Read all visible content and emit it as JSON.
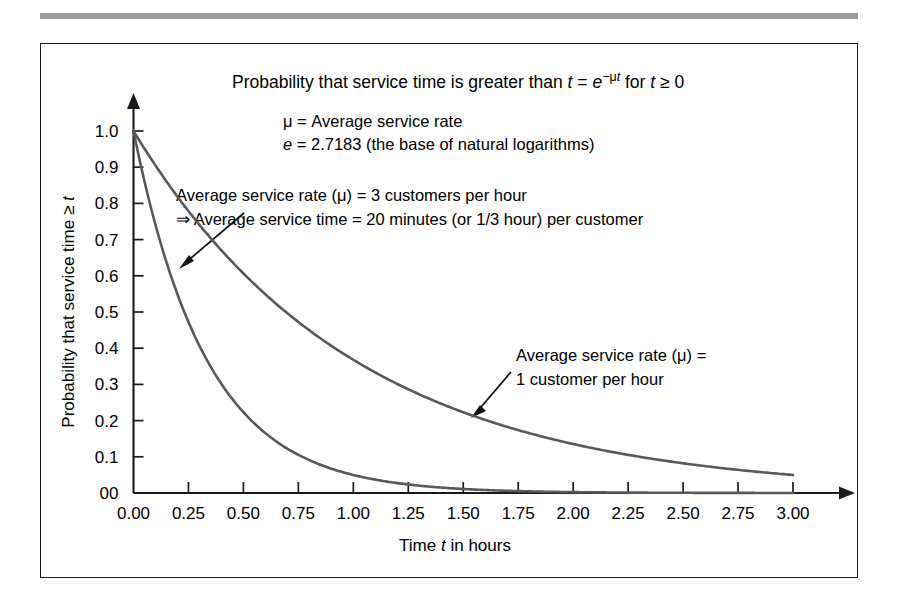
{
  "figure": {
    "title_parts": {
      "lead": "Probability that service time is greater than ",
      "var_t": "t",
      "eq": " = ",
      "var_e": "e",
      "exponent_minus": "−μ",
      "exponent_t": "t",
      "tail": " for ",
      "var_t2": "t",
      "ge_zero": " ≥ 0"
    },
    "title_plain": "Probability that service time is greater than t = e^(−μt) for t ≥ 0",
    "legend_notes": [
      {
        "prefix": "μ",
        "rest": " = Average service rate"
      },
      {
        "prefix": "e",
        "rest": " = 2.7183 (the base of natural logarithms)"
      }
    ],
    "annotations": [
      {
        "name": "mu3-annotation",
        "lines": [
          "Average service rate (μ) = 3 customers per hour",
          "⇒ Average service time = 20 minutes (or 1/3 hour) per customer"
        ]
      },
      {
        "name": "mu1-annotation",
        "lines": [
          "Average service rate (μ) =",
          "1 customer per hour"
        ]
      }
    ]
  },
  "chart_data": {
    "type": "line",
    "xlabel": "Time t in hours",
    "ylabel": "Probability that service time ≥ t",
    "xlim": [
      0,
      3
    ],
    "ylim": [
      0,
      1
    ],
    "grid": false,
    "legend_position": "inline-annotations",
    "x_ticklabels": [
      "0.00",
      "0.25",
      "0.50",
      "0.75",
      "1.00",
      "1.25",
      "1.50",
      "1.75",
      "2.00",
      "2.25",
      "2.50",
      "2.75",
      "3.00"
    ],
    "x_tickvalues": [
      0,
      0.25,
      0.5,
      0.75,
      1,
      1.25,
      1.5,
      1.75,
      2,
      2.25,
      2.5,
      2.75,
      3
    ],
    "y_ticklabels": [
      "00",
      "0.1",
      "0.2",
      "0.3",
      "0.4",
      "0.5",
      "0.6",
      "0.7",
      "0.8",
      "0.9",
      "1.0"
    ],
    "y_tickvalues": [
      0,
      0.1,
      0.2,
      0.3,
      0.4,
      0.5,
      0.6,
      0.7,
      0.8,
      0.9,
      1.0
    ],
    "series": [
      {
        "name": "Average service rate (μ) = 1 customer per hour",
        "mu": 1,
        "color": "#595959",
        "x": [
          0,
          0.25,
          0.5,
          0.75,
          1,
          1.25,
          1.5,
          1.75,
          2,
          2.25,
          2.5,
          2.75,
          3
        ],
        "values": [
          1.0,
          0.779,
          0.607,
          0.472,
          0.368,
          0.287,
          0.223,
          0.174,
          0.135,
          0.105,
          0.082,
          0.064,
          0.05
        ]
      },
      {
        "name": "Average service rate (μ) = 3 customers per hour",
        "mu": 3,
        "color": "#595959",
        "x": [
          0,
          0.25,
          0.5,
          0.75,
          1,
          1.25,
          1.5,
          1.75,
          2,
          2.25,
          2.5,
          2.75,
          3
        ],
        "values": [
          1.0,
          0.472,
          0.223,
          0.105,
          0.05,
          0.024,
          0.011,
          0.005,
          0.002,
          0.001,
          0.001,
          0.0,
          0.0
        ]
      }
    ]
  }
}
